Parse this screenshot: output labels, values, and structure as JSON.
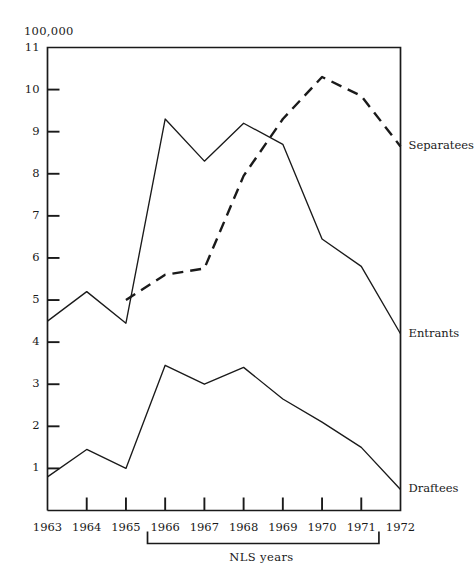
{
  "chart_data": {
    "type": "line",
    "title": "",
    "unit_label": "100,000",
    "xlabel": "NLS years",
    "ylabel": "",
    "x": [
      1963,
      1964,
      1965,
      1966,
      1967,
      1968,
      1969,
      1970,
      1971,
      1972
    ],
    "categories": [
      "1963",
      "1964",
      "1965",
      "1966",
      "1967",
      "1968",
      "1969",
      "1970",
      "1971",
      "1972"
    ],
    "xlim": [
      1963,
      1972
    ],
    "ylim": [
      0,
      11
    ],
    "yticks": [
      1,
      2,
      3,
      4,
      5,
      6,
      7,
      8,
      9,
      10,
      11
    ],
    "ytick_labels": [
      "1",
      "2",
      "3",
      "4",
      "5",
      "6",
      "7",
      "8",
      "9",
      "10",
      "11"
    ],
    "grid": false,
    "legend_position": "right-of-line-ends",
    "bracket": {
      "label": "NLS years",
      "from": 1965.55,
      "to": 1971.45
    },
    "series": [
      {
        "name": "Entrants",
        "style": "solid",
        "x": [
          1963,
          1964,
          1965,
          1966,
          1967,
          1968,
          1969,
          1970,
          1971,
          1972
        ],
        "values": [
          4.5,
          5.2,
          4.45,
          9.3,
          8.3,
          9.2,
          8.7,
          6.45,
          5.8,
          4.2
        ],
        "label_at": {
          "x": 1972,
          "y": 4.2
        }
      },
      {
        "name": "Separatees",
        "style": "dashed",
        "x": [
          1965,
          1966,
          1967,
          1968,
          1969,
          1970,
          1971,
          1972
        ],
        "values": [
          5.0,
          5.6,
          5.75,
          7.95,
          9.3,
          10.3,
          9.85,
          8.65
        ],
        "label_at": {
          "x": 1972,
          "y": 8.65
        }
      },
      {
        "name": "Draftees",
        "style": "solid",
        "x": [
          1963,
          1964,
          1965,
          1966,
          1967,
          1968,
          1969,
          1970,
          1971,
          1972
        ],
        "values": [
          0.8,
          1.45,
          1.0,
          3.45,
          3.0,
          3.4,
          2.65,
          2.1,
          1.5,
          0.5
        ],
        "label_at": {
          "x": 1972,
          "y": 0.5
        }
      }
    ]
  },
  "labels": {
    "unit": "100,000",
    "axis_caption": "NLS years",
    "series": {
      "separatees": "Separatees",
      "entrants": "Entrants",
      "draftees": "Draftees"
    }
  },
  "colors": {
    "ink": "#1a1a1a",
    "background": "#ffffff"
  }
}
